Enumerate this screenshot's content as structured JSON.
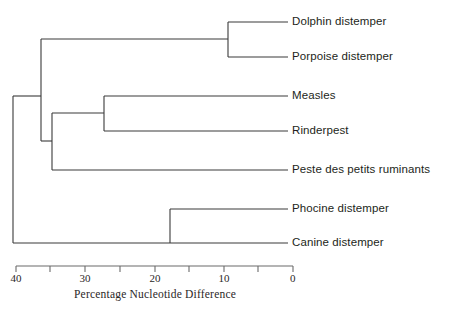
{
  "figure": {
    "kind": "phylogenetic-tree",
    "background_color": "#ffffff",
    "line_color": "#3a3a3a"
  },
  "axis": {
    "title": "Percentage Nucleotide Difference",
    "orientation": "reversed",
    "domain_left_value": 40,
    "domain_right_value": 0,
    "pixel_left": 16,
    "pixel_right": 293,
    "baseline_y": 266,
    "tick_interval": 5,
    "labeled_ticks": [
      {
        "value": 40,
        "label": "40",
        "x": 16
      },
      {
        "value": 30,
        "label": "30",
        "x": 85
      },
      {
        "value": 20,
        "label": "20",
        "x": 155
      },
      {
        "value": 10,
        "label": "10",
        "x": 224
      },
      {
        "value": 0,
        "label": "0",
        "x": 293
      }
    ],
    "minor_ticks": [
      {
        "value": 35,
        "x": 50
      },
      {
        "value": 25,
        "x": 120
      },
      {
        "value": 15,
        "x": 189
      },
      {
        "value": 5,
        "x": 258
      }
    ]
  },
  "leaves": [
    {
      "id": "dolphin",
      "label": "Dolphin distemper",
      "y": 22,
      "tip_x": 288,
      "label_x": 292
    },
    {
      "id": "porpoise",
      "label": "Porpoise distemper",
      "y": 57,
      "tip_x": 288,
      "label_x": 292
    },
    {
      "id": "measles",
      "label": "Measles",
      "y": 96,
      "tip_x": 288,
      "label_x": 292
    },
    {
      "id": "rinderpest",
      "label": "Rinderpest",
      "y": 131,
      "tip_x": 288,
      "label_x": 292
    },
    {
      "id": "peste",
      "label": "Peste des petits ruminants",
      "y": 170,
      "tip_x": 288,
      "label_x": 292
    },
    {
      "id": "phocine",
      "label": "Phocine distemper",
      "y": 209,
      "tip_x": 288,
      "label_x": 292
    },
    {
      "id": "canine",
      "label": "Canine distemper",
      "y": 243,
      "tip_x": 288,
      "label_x": 292
    }
  ],
  "nodes": [
    {
      "id": "node-dolphin-porpoise",
      "x": 228,
      "value": 9.4,
      "y_top": 22,
      "y_bottom": 57,
      "children": [
        "dolphin",
        "porpoise"
      ]
    },
    {
      "id": "node-measles-rinderpest",
      "x": 104,
      "value": 27.3,
      "y_top": 96,
      "y_bottom": 131,
      "children": [
        "measles",
        "rinderpest"
      ]
    },
    {
      "id": "node-morbillivirus-core",
      "x": 52,
      "value": 34.8,
      "y_top": 113,
      "y_bottom": 170,
      "children": [
        "node-measles-rinderpest",
        "peste"
      ]
    },
    {
      "id": "node-cetacean-clade",
      "x": 41,
      "value": 36.3,
      "y_top": 39,
      "y_bottom": 141,
      "children": [
        "node-dolphin-porpoise",
        "node-morbillivirus-core"
      ]
    },
    {
      "id": "node-phocine-canine",
      "x": 170,
      "value": 17.7,
      "y_top": 209,
      "y_bottom": 243,
      "children": [
        "phocine",
        "canine"
      ]
    },
    {
      "id": "node-root",
      "x": 13,
      "value": 40.0,
      "y_top": 96,
      "y_bottom": 243,
      "children": [
        "node-cetacean-clade",
        "node-phocine-canine"
      ]
    }
  ],
  "chart_data": {
    "type": "line",
    "title": "",
    "xlabel": "Percentage Nucleotide Difference",
    "ylabel": "",
    "xlim": [
      40,
      0
    ],
    "grid": false,
    "legend": "none",
    "categories": [
      "Dolphin distemper",
      "Porpoise distemper",
      "Measles",
      "Rinderpest",
      "Peste des petits ruminants",
      "Phocine distemper",
      "Canine distemper"
    ],
    "tick_labels": [
      "40",
      "30",
      "20",
      "10",
      "0"
    ],
    "values": [
      0,
      0,
      0,
      0,
      0,
      0,
      0
    ],
    "node_divergence_percent": [
      {
        "clade": "Dolphin distemper + Porpoise distemper",
        "value": 9.4
      },
      {
        "clade": "Phocine distemper + Canine distemper",
        "value": 17.7
      },
      {
        "clade": "Measles + Rinderpest",
        "value": 27.3
      },
      {
        "clade": "(Measles, Rinderpest) + Peste des petits ruminants",
        "value": 34.8
      },
      {
        "clade": "(Dolphin, Porpoise) + (Measles, Rinderpest, Peste)",
        "value": 36.3
      },
      {
        "clade": "root",
        "value": 40.0
      }
    ]
  }
}
